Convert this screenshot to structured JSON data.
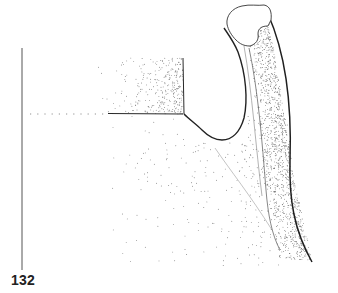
{
  "figure": {
    "label": "132",
    "colors": {
      "ink": "#2a2a2a",
      "stipple": "#4a4a4a",
      "axis_line": "#555555",
      "background": "#ffffff"
    },
    "axis_line": {
      "x": 22,
      "y1": 48,
      "y2": 270
    }
  }
}
